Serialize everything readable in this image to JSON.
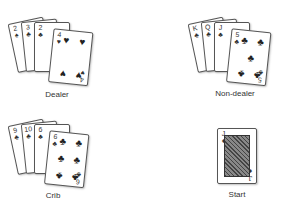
{
  "hands": [
    {
      "id": "dealer",
      "label": "Dealer",
      "cards": [
        {
          "rank": "2",
          "suit": "♠"
        },
        {
          "rank": "3",
          "suit": "♣"
        },
        {
          "rank": "2",
          "suit": "♣"
        },
        {
          "rank": "4",
          "suit": "♥"
        }
      ]
    },
    {
      "id": "non-dealer",
      "label": "Non-dealer",
      "cards": [
        {
          "rank": "K",
          "suit": "♣"
        },
        {
          "rank": "Q",
          "suit": "♣"
        },
        {
          "rank": "J",
          "suit": "♣"
        },
        {
          "rank": "5",
          "suit": "♣"
        }
      ]
    },
    {
      "id": "crib",
      "label": "Crib",
      "cards": [
        {
          "rank": "9",
          "suit": "♣"
        },
        {
          "rank": "10",
          "suit": "♣"
        },
        {
          "rank": "6",
          "suit": "♣"
        },
        {
          "rank": "6",
          "suit": "♣"
        }
      ]
    },
    {
      "id": "start",
      "label": "Start",
      "cards": [
        {
          "rank": "J",
          "suit": "♦"
        }
      ]
    }
  ]
}
